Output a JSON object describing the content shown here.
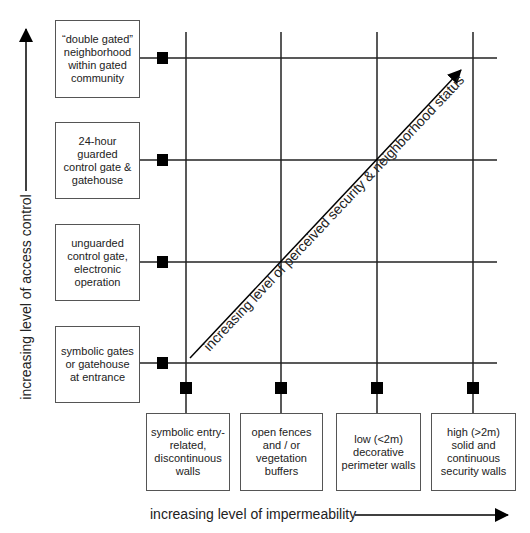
{
  "diagram": {
    "type": "matrix-diagram",
    "y_axis": {
      "label": "increasing level of access control",
      "levels": [
        {
          "label": "symbolic gates\nor gatehouse\nat entrance"
        },
        {
          "label": "unguarded\ncontrol gate,\nelectronic\noperation"
        },
        {
          "label": "24-hour\nguarded\ncontrol gate &\ngatehouse"
        },
        {
          "label": "“double gated”\nneighborhood\nwithin gated\ncommunity"
        }
      ]
    },
    "x_axis": {
      "label": "increasing level of impermeability",
      "levels": [
        {
          "label": "symbolic entry-\nrelated,\ndiscontinuous\nwalls"
        },
        {
          "label": "open fences\nand / or\nvegetation\nbuffers"
        },
        {
          "label": "low (<2m)\ndecorative\nperimeter walls"
        },
        {
          "label": "high (>2m)\nsolid and\ncontinuous\nsecurity walls"
        }
      ]
    },
    "diagonal": {
      "label": "increasing level of perceived security & neighborhood status"
    },
    "colors": {
      "line": "#222222",
      "marker": "#000000",
      "box_border": "#555555",
      "background": "#ffffff"
    }
  }
}
